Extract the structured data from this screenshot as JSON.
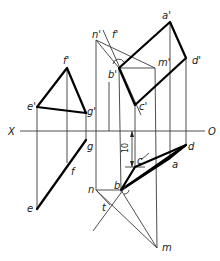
{
  "diagram": {
    "type": "descriptive-geometry-projection",
    "axis": {
      "left_label": "X",
      "right_label": "O"
    },
    "labels": {
      "f_prime": "f'",
      "e_prime": "e'",
      "g_prime": "g'",
      "e": "e",
      "f": "f",
      "g": "g",
      "n_prime": "n'",
      "f_prime_right": "f'",
      "a_prime": "a'",
      "b_prime": "b'",
      "m_prime": "m'",
      "d_prime": "d'",
      "c_prime": "c'",
      "d": "d",
      "c": "c",
      "a": "a",
      "b": "b",
      "n": "n",
      "t": "t",
      "m": "m"
    },
    "dimension": {
      "value": "10"
    },
    "colors": {
      "line": "#000000",
      "thin_line": "#3a3a3a",
      "background": "#ffffff"
    }
  }
}
